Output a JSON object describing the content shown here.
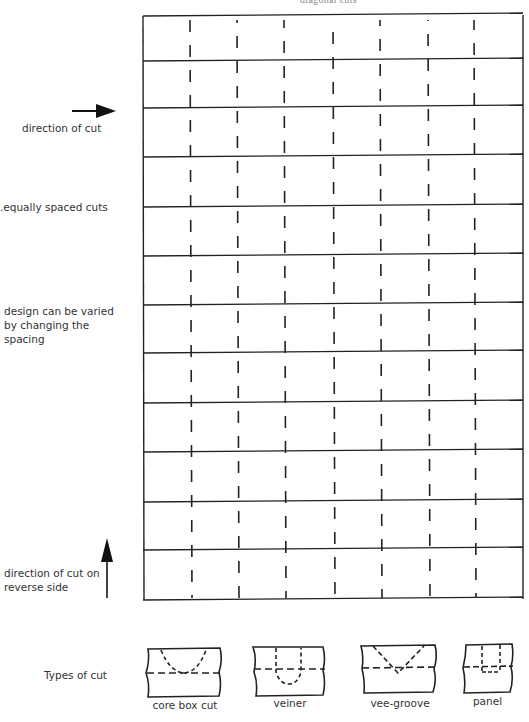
{
  "header": {
    "title_fragment": "diagonal cuts"
  },
  "labels": {
    "direction_of_cut": "direction of cut",
    "equally_spaced": ".equally spaced cuts",
    "design_varied": "design can be varied\nby changing the\nspacing",
    "reverse_side": "direction of cut on\nreverse side",
    "types_of_cut": "Types of cut"
  },
  "grid": {
    "left": 143,
    "right": 523,
    "row_lines": [
      16,
      61,
      108,
      157,
      207,
      256,
      305,
      353,
      403,
      452,
      502,
      550,
      600
    ],
    "columns": [
      190,
      237,
      284,
      333,
      380,
      428,
      474
    ],
    "line_color": "#222222"
  },
  "cut_types": [
    {
      "name": "core box cut"
    },
    {
      "name": "veiner"
    },
    {
      "name": "vee-groove"
    },
    {
      "name": "panel"
    }
  ]
}
